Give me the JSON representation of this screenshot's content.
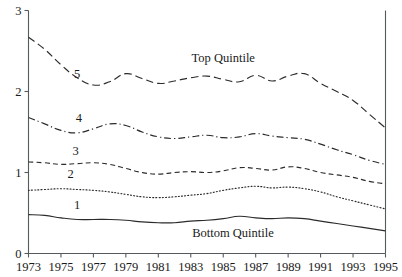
{
  "chart_data": {
    "type": "line",
    "title": "",
    "xlabel": "",
    "ylabel": "",
    "xlim": [
      1973,
      1995
    ],
    "ylim": [
      0,
      3
    ],
    "grid": false,
    "legend_position": "inline-labels",
    "xticks": [
      1973,
      1975,
      1977,
      1979,
      1981,
      1983,
      1985,
      1987,
      1989,
      1991,
      1993,
      1995
    ],
    "yticks": [
      0,
      1,
      2,
      3
    ],
    "x": [
      1973,
      1974,
      1975,
      1976,
      1977,
      1978,
      1979,
      1980,
      1981,
      1982,
      1983,
      1984,
      1985,
      1986,
      1987,
      1988,
      1989,
      1990,
      1991,
      1992,
      1993,
      1994,
      1995
    ],
    "annotations": [
      {
        "text": "Top Quintile",
        "x": 1985.0,
        "y": 2.36
      },
      {
        "text": "Bottom Quintile",
        "x": 1985.6,
        "y": 0.2
      }
    ],
    "series": [
      {
        "name": "5",
        "label": "Top Quintile",
        "style": "dashed-long",
        "label_x": 1976.0,
        "label_y": 2.17,
        "values": [
          2.67,
          2.52,
          2.33,
          2.17,
          2.08,
          2.12,
          2.22,
          2.16,
          2.1,
          2.13,
          2.17,
          2.19,
          2.15,
          2.12,
          2.2,
          2.13,
          2.19,
          2.22,
          2.1,
          2.0,
          1.89,
          1.72,
          1.55
        ]
      },
      {
        "name": "4",
        "style": "dashdot",
        "label_x": 1976.1,
        "label_y": 1.62,
        "values": [
          1.68,
          1.6,
          1.52,
          1.49,
          1.54,
          1.6,
          1.58,
          1.5,
          1.44,
          1.42,
          1.44,
          1.46,
          1.43,
          1.44,
          1.48,
          1.45,
          1.43,
          1.41,
          1.35,
          1.28,
          1.22,
          1.15,
          1.1
        ]
      },
      {
        "name": "3",
        "style": "dashed-short",
        "label_x": 1975.9,
        "label_y": 1.22,
        "values": [
          1.13,
          1.12,
          1.1,
          1.11,
          1.12,
          1.1,
          1.05,
          1.0,
          0.98,
          1.0,
          1.01,
          1.0,
          1.02,
          1.06,
          1.05,
          1.03,
          1.07,
          1.05,
          1.0,
          0.97,
          0.94,
          0.89,
          0.86
        ]
      },
      {
        "name": "2",
        "style": "dotted",
        "label_x": 1975.6,
        "label_y": 0.93,
        "values": [
          0.78,
          0.79,
          0.8,
          0.79,
          0.78,
          0.76,
          0.73,
          0.7,
          0.69,
          0.7,
          0.72,
          0.74,
          0.78,
          0.81,
          0.83,
          0.81,
          0.82,
          0.8,
          0.76,
          0.7,
          0.65,
          0.6,
          0.55
        ]
      },
      {
        "name": "1",
        "label": "Bottom Quintile",
        "style": "solid",
        "label_x": 1976.0,
        "label_y": 0.55,
        "values": [
          0.48,
          0.47,
          0.44,
          0.42,
          0.42,
          0.42,
          0.41,
          0.39,
          0.38,
          0.38,
          0.4,
          0.41,
          0.43,
          0.46,
          0.44,
          0.43,
          0.44,
          0.43,
          0.4,
          0.37,
          0.34,
          0.31,
          0.28
        ]
      }
    ]
  }
}
